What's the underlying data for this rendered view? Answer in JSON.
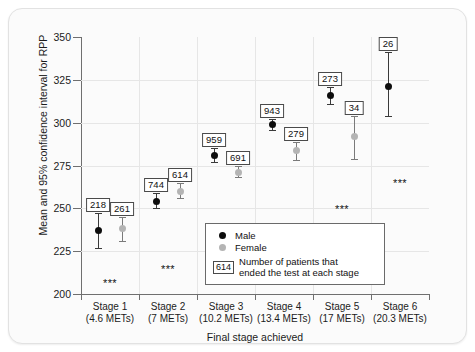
{
  "chart_data": {
    "type": "scatter",
    "title": "",
    "xlabel": "Final stage achieved",
    "ylabel": "Mean and 95% confidence interval for RPP",
    "ylim": [
      200,
      350
    ],
    "yticks": [
      200,
      225,
      250,
      275,
      300,
      325,
      350
    ],
    "grid": true,
    "legend_position": "bottom-right",
    "categories": [
      "Stage 1",
      "Stage 2",
      "Stage 3",
      "Stage 4",
      "Stage 5",
      "Stage 6"
    ],
    "category_sublabels": [
      "(4.6 METs)",
      "(7 METs)",
      "(10.2 METs)",
      "(13.4 METs)",
      "(17 METs)",
      "(20.3 METs)"
    ],
    "series": [
      {
        "name": "Male",
        "color": "#0d0d0d",
        "values": [
          237,
          254,
          281,
          299,
          316,
          321
        ],
        "ci_low": [
          227,
          250,
          277,
          296,
          311,
          304
        ],
        "ci_high": [
          247,
          259,
          285,
          302,
          321,
          341
        ],
        "n_labels": [
          "218",
          "744",
          "959",
          "943",
          "273",
          "26"
        ]
      },
      {
        "name": "Female",
        "color": "#b4b4b4",
        "values": [
          238,
          260,
          271,
          284,
          292,
          null
        ],
        "ci_low": [
          231,
          256,
          268,
          278,
          279,
          null
        ],
        "ci_high": [
          245,
          265,
          275,
          289,
          304,
          null
        ],
        "n_labels": [
          "261",
          "614",
          "691",
          "279",
          "34",
          ""
        ]
      }
    ],
    "significance_markers": [
      {
        "category": "Stage 1",
        "text": "***",
        "y": 206
      },
      {
        "category": "Stage 2",
        "text": "***",
        "y": 214
      },
      {
        "category": "Stage 3",
        "text": "***",
        "y": 226
      },
      {
        "category": "Stage 4",
        "text": "***",
        "y": 237
      },
      {
        "category": "Stage 5",
        "text": "***",
        "y": 249
      },
      {
        "category": "Stage 6",
        "text": "***",
        "y": 264
      }
    ]
  },
  "legend": {
    "male_label": "Male",
    "female_label": "Female",
    "n_example": "614",
    "n_text_line1": "Number of patients that",
    "n_text_line2": "ended the test at each stage"
  },
  "axes": {
    "ytick_labels": [
      "350",
      "325",
      "300",
      "275",
      "250",
      "225",
      "200"
    ],
    "ylabel": "Mean and 95% confidence interval for RPP",
    "xlabel": "Final stage achieved"
  }
}
